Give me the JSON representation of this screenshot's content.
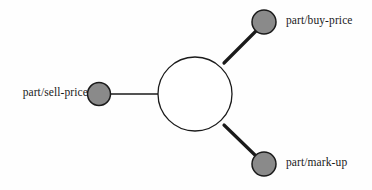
{
  "diagram": {
    "type": "node-link-graph",
    "background_color": "#fefefe",
    "stroke_color": "#1a1a1a",
    "node_fill_color": "#8a8a8a",
    "central_node": {
      "name": "central-hub-node",
      "label": "",
      "cx": 195,
      "cy": 94,
      "r": 37,
      "fill": "#ffffff",
      "stroke_width": 1.3
    },
    "nodes": [
      {
        "id": "sell-price",
        "label": "part/sell-price",
        "cx": 99,
        "cy": 94,
        "r": 11.5,
        "fill": "#8a8a8a",
        "label_side": "left",
        "label_x": 88,
        "label_y": 94
      },
      {
        "id": "buy-price",
        "label": "part/buy-price",
        "cx": 264,
        "cy": 22,
        "r": 12,
        "fill": "#8a8a8a",
        "label_side": "right",
        "label_x": 286,
        "label_y": 22
      },
      {
        "id": "mark-up",
        "label": "part/mark-up",
        "cx": 264,
        "cy": 164,
        "r": 12,
        "fill": "#8a8a8a",
        "label_side": "right",
        "label_x": 286,
        "label_y": 164
      }
    ],
    "edges": [
      {
        "id": "edge-sell-price",
        "from": "central-hub-node",
        "to": "sell-price",
        "x1": 158,
        "y1": 94,
        "x2": 110,
        "y2": 94,
        "width": 1.3
      },
      {
        "id": "edge-buy-price",
        "from": "central-hub-node",
        "to": "buy-price",
        "x1": 224,
        "y1": 63,
        "x2": 256,
        "y2": 31,
        "width": 3.2
      },
      {
        "id": "edge-mark-up",
        "from": "central-hub-node",
        "to": "mark-up",
        "x1": 224,
        "y1": 125,
        "x2": 256,
        "y2": 156,
        "width": 3.2
      }
    ]
  }
}
